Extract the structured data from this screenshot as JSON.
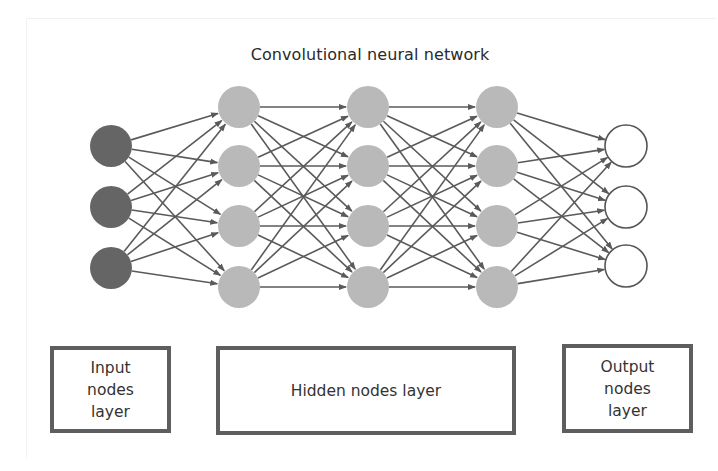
{
  "title": "Convolutional neural network",
  "colors": {
    "input_node": "#656565",
    "hidden_node": "#b9b9b9",
    "output_node": "#ffffff",
    "edge": "#5a5a5a",
    "box_border": "#5e5e5e",
    "text": "#2a2a2a"
  },
  "layers": [
    {
      "name": "input",
      "node_count": 3,
      "x": 111,
      "ys": [
        146,
        207,
        268
      ]
    },
    {
      "name": "hidden-1",
      "node_count": 4,
      "x": 239,
      "ys": [
        107,
        166,
        226,
        287
      ]
    },
    {
      "name": "hidden-2",
      "node_count": 4,
      "x": 368,
      "ys": [
        107,
        166,
        226,
        287
      ]
    },
    {
      "name": "hidden-3",
      "node_count": 4,
      "x": 497,
      "ys": [
        107,
        166,
        226,
        287
      ]
    },
    {
      "name": "output",
      "node_count": 3,
      "x": 626,
      "ys": [
        146,
        207,
        266
      ]
    }
  ],
  "node_radius": 21,
  "connectivity": "fully-connected between adjacent layers (arrows left to right)",
  "legend_boxes": {
    "input": "Input\nnodes\nlayer",
    "hidden": "Hidden nodes layer",
    "output": "Output\nnodes\nlayer"
  }
}
